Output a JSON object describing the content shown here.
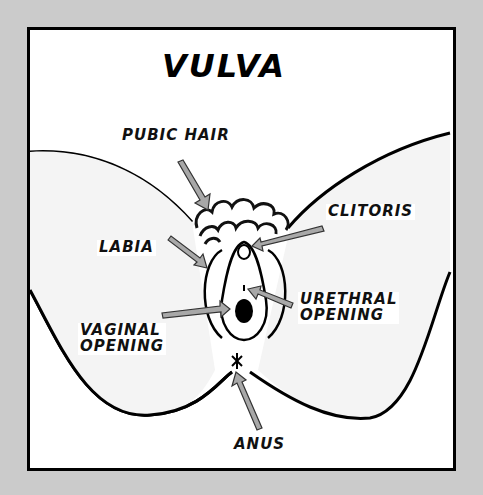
{
  "diagram": {
    "title": "VULVA",
    "labels": {
      "pubic_hair": "PUBIC HAIR",
      "clitoris": "CLITORIS",
      "labia": "LABIA",
      "urethral_opening_line1": "URETHRAL",
      "urethral_opening_line2": "OPENING",
      "vaginal_opening_line1": "VAGINAL",
      "vaginal_opening_line2": "OPENING",
      "anus": "ANUS"
    },
    "colors": {
      "background": "#cbcbcb",
      "frame": "#000000",
      "panel": "#ffffff",
      "thigh_fill": "#f4f4f4",
      "arrow_fill": "#a8a8a8",
      "ink": "#111111"
    }
  }
}
